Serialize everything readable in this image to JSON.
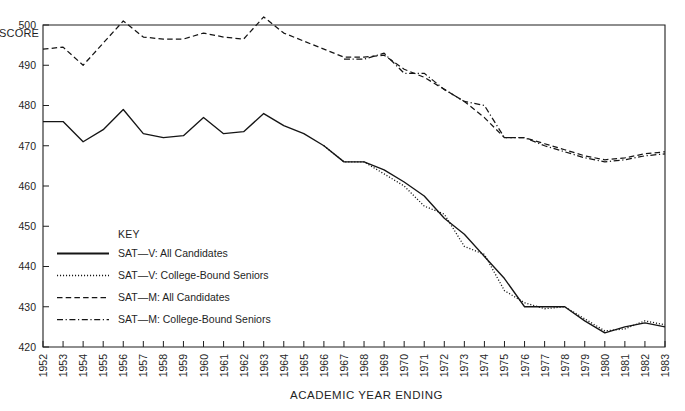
{
  "chart_data": {
    "type": "line",
    "title": "",
    "subtitle": "",
    "xlabel": "ACADEMIC YEAR ENDING",
    "ylabel": "SCORE",
    "ylabel_clipped": "SCORE",
    "xlim": [
      1952,
      1983
    ],
    "ylim": [
      420,
      500
    ],
    "grid": false,
    "legend_position": "inside-left-middle",
    "legend_title": "KEY",
    "x": [
      1952,
      1953,
      1954,
      1955,
      1956,
      1957,
      1958,
      1959,
      1960,
      1961,
      1962,
      1963,
      1964,
      1965,
      1966,
      1967,
      1968,
      1969,
      1970,
      1971,
      1972,
      1973,
      1974,
      1975,
      1976,
      1977,
      1978,
      1979,
      1980,
      1981,
      1982,
      1983
    ],
    "categories": [
      "1952",
      "1953",
      "1954",
      "1955",
      "1956",
      "1957",
      "1958",
      "1959",
      "1960",
      "1961",
      "1962",
      "1963",
      "1964",
      "1965",
      "1966",
      "1967",
      "1968",
      "1969",
      "1970",
      "1971",
      "1972",
      "1973",
      "1974",
      "1975",
      "1976",
      "1977",
      "1978",
      "1979",
      "1980",
      "1981",
      "1982",
      "1983"
    ],
    "yticks": [
      420,
      430,
      440,
      450,
      460,
      470,
      480,
      490,
      500
    ],
    "ytick_labels": [
      "420",
      "430",
      "440",
      "450",
      "460",
      "470",
      "480",
      "490",
      "500"
    ],
    "series": [
      {
        "name": "SAT—V: All Candidates",
        "line_style": "solid",
        "color": "#151515",
        "x": [
          1952,
          1953,
          1954,
          1955,
          1956,
          1957,
          1958,
          1959,
          1960,
          1961,
          1962,
          1963,
          1964,
          1965,
          1966,
          1967,
          1968,
          1969,
          1970,
          1971,
          1972,
          1973,
          1974,
          1975,
          1976,
          1977,
          1978,
          1979,
          1980,
          1981,
          1982,
          1983
        ],
        "values": [
          476,
          476,
          471,
          474,
          479,
          473,
          472,
          472.5,
          477,
          473,
          473.5,
          478,
          475,
          473,
          470,
          466,
          466,
          464,
          461,
          457.5,
          452,
          448,
          442.5,
          437,
          430,
          430,
          430,
          426.5,
          423.5,
          425,
          426,
          425
        ]
      },
      {
        "name": "SAT—V: College-Bound Seniors",
        "line_style": "dotted",
        "color": "#151515",
        "x": [
          1966,
          1967,
          1968,
          1969,
          1970,
          1971,
          1972,
          1973,
          1974,
          1975,
          1976,
          1977,
          1978,
          1979,
          1980,
          1981,
          1982,
          1983
        ],
        "values": [
          470,
          466,
          466,
          463,
          460,
          455,
          453,
          445,
          443,
          434,
          431,
          429.5,
          430,
          427,
          424,
          424.5,
          426.5,
          425.5
        ]
      },
      {
        "name": "SAT—M: All Candidates",
        "line_style": "dashed",
        "color": "#151515",
        "x": [
          1952,
          1953,
          1954,
          1955,
          1956,
          1957,
          1958,
          1959,
          1960,
          1961,
          1962,
          1963,
          1964,
          1965,
          1966,
          1967,
          1968,
          1969,
          1970,
          1971,
          1972,
          1973,
          1974,
          1975,
          1976,
          1977,
          1978,
          1979,
          1980,
          1981,
          1982,
          1983
        ],
        "values": [
          494,
          494.5,
          490,
          495.5,
          501,
          497,
          496.5,
          496.5,
          498,
          497,
          496.5,
          502,
          498,
          496,
          494,
          492,
          492,
          492.5,
          489,
          487,
          484,
          481,
          477,
          472,
          472,
          470.5,
          469,
          467.5,
          466.5,
          467,
          468,
          468.5
        ]
      },
      {
        "name": "SAT—M: College-Bound Seniors",
        "line_style": "dashdot",
        "color": "#151515",
        "x": [
          1967,
          1968,
          1969,
          1970,
          1971,
          1972,
          1973,
          1974,
          1975,
          1976,
          1977,
          1978,
          1979,
          1980,
          1981,
          1982,
          1983
        ],
        "values": [
          491.5,
          491.5,
          493,
          488,
          488,
          484,
          481,
          480,
          472,
          472,
          470,
          468.5,
          467,
          466,
          466.5,
          467.5,
          468
        ]
      }
    ],
    "legend_entries": [
      {
        "label": "SAT—V: All Candidates",
        "line_style": "solid"
      },
      {
        "label": "SAT—V: College-Bound Seniors",
        "line_style": "dotted"
      },
      {
        "label": "SAT—M: All Candidates",
        "line_style": "dashed"
      },
      {
        "label": "SAT—M: College-Bound Seniors",
        "line_style": "dashdot"
      }
    ]
  },
  "layout": {
    "plot_left": 43,
    "plot_right": 665,
    "plot_top": 25,
    "plot_bottom": 347
  }
}
